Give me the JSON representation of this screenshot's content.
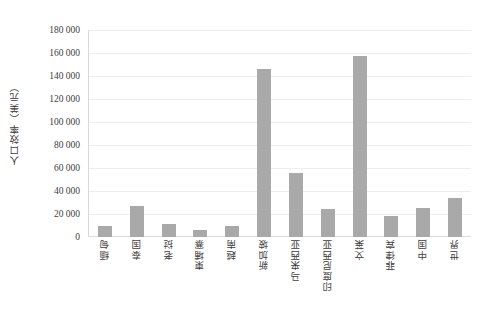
{
  "chart_data": {
    "type": "bar",
    "title": "",
    "xlabel": "",
    "ylabel": "人口效率（美元）",
    "ylim": [
      0,
      180000
    ],
    "ytick_step": 20000,
    "grid": true,
    "legend": "none",
    "bar_color": "#a9a9a9",
    "gridline_color": "#ededed",
    "axis_color": "#d9d9d9",
    "categories": [
      "缅甸",
      "泰国",
      "老挝",
      "柬埔寨",
      "越南",
      "新加坡",
      "马来西亚",
      "印度尼西亚",
      "文莱",
      "菲律宾",
      "中国",
      "世界"
    ],
    "values": [
      10000,
      27000,
      11000,
      6000,
      10000,
      146000,
      56000,
      24000,
      157000,
      18000,
      25000,
      34000
    ],
    "ytick_labels": [
      "180 000",
      "160 000",
      "140 000",
      "120 000",
      "100 000",
      "80 000",
      "60 000",
      "40 000",
      "20 000",
      "0"
    ],
    "ytick_values": [
      180000,
      160000,
      140000,
      120000,
      100000,
      80000,
      60000,
      40000,
      20000,
      0
    ]
  }
}
